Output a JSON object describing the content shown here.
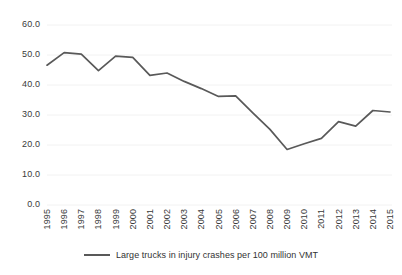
{
  "chart_data": {
    "type": "line",
    "title": "",
    "subtitle": "",
    "xlabel": "",
    "ylabel": "",
    "categories": [
      "1995",
      "1996",
      "1997",
      "1998",
      "1999",
      "2000",
      "2001",
      "2002",
      "2003",
      "2004",
      "2005",
      "2006",
      "2007",
      "2008",
      "2009",
      "2010",
      "2011",
      "2012",
      "2013",
      "2014",
      "2015"
    ],
    "series": [
      {
        "name": "Large trucks in injury crashes per 100 million VMT",
        "color": "#595959",
        "values": [
          46.6,
          50.8,
          50.3,
          44.8,
          49.6,
          49.2,
          43.2,
          44.0,
          41.2,
          38.8,
          36.2,
          36.4,
          30.7,
          25.2,
          18.5,
          20.4,
          22.2,
          27.8,
          26.3,
          31.5,
          31.0
        ]
      }
    ],
    "ylim": [
      0,
      60
    ],
    "ytick_values": [
      0,
      10,
      20,
      30,
      40,
      50,
      60
    ],
    "ytick_labels": [
      "0.0",
      "10.0",
      "20.0",
      "30.0",
      "40.0",
      "50.0",
      "60.0"
    ],
    "grid": true,
    "grid_axis": "y",
    "grid_color": "#f2f2f2",
    "legend": {
      "position": "bottom",
      "entries": [
        {
          "label": "Large trucks in injury crashes per 100 million VMT",
          "color": "#595959"
        }
      ]
    }
  }
}
